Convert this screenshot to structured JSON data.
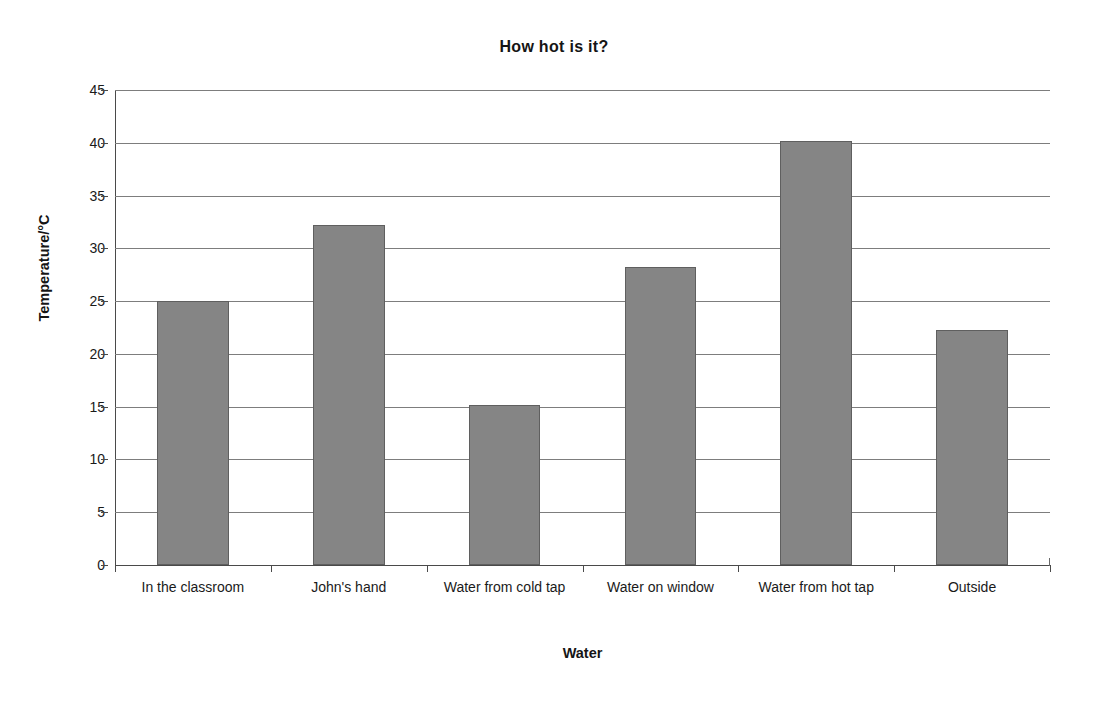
{
  "chart_data": {
    "type": "bar",
    "title": "How hot is it?",
    "xlabel": "Water",
    "ylabel": "Temperature/°C",
    "categories": [
      "In the classroom",
      "John's hand",
      "Water from cold tap",
      "Water on window",
      "Water from hot tap",
      "Outside"
    ],
    "values": [
      25.0,
      32.2,
      15.2,
      28.2,
      40.2,
      22.3
    ],
    "ylim": [
      0,
      45
    ],
    "ytick_step": 5,
    "ytick_labels": [
      "0",
      "5",
      "10",
      "15",
      "20",
      "25",
      "30",
      "35",
      "40",
      "45"
    ],
    "grid": "horizontal",
    "legend": "none",
    "bar_color": "#858585",
    "bar_edge_color": "#5f5f5f",
    "gridline_color": "#7d7d7d",
    "axis_color": "#4a4a4a",
    "background_color": "#ffffff",
    "text_color": "#1a1a1a"
  }
}
